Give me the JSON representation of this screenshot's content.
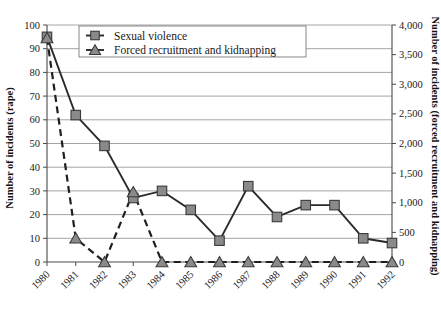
{
  "chart_data": {
    "type": "line",
    "title": "",
    "xlabel": "",
    "ylabel": "Number of incidents (rape)",
    "y2label": "Number of incidents (forced recruitment and kidnapping)",
    "categories": [
      "1980",
      "1981",
      "1982",
      "1983",
      "1984",
      "1985",
      "1986",
      "1987",
      "1988",
      "1989",
      "1990",
      "1991",
      "1992"
    ],
    "x": [
      1980,
      1981,
      1982,
      1983,
      1984,
      1985,
      1986,
      1987,
      1988,
      1989,
      1990,
      1991,
      1992
    ],
    "ylim": [
      0,
      100
    ],
    "y2lim": [
      0,
      4000
    ],
    "yticks": [
      0,
      10,
      20,
      30,
      40,
      50,
      60,
      70,
      80,
      90,
      100
    ],
    "ytick_labels": [
      "0",
      "10",
      "20",
      "30",
      "40",
      "50",
      "60",
      "70",
      "80",
      "90",
      "100"
    ],
    "y2ticks": [
      0,
      500,
      1000,
      1500,
      2000,
      2500,
      3000,
      3500,
      4000
    ],
    "y2tick_labels": [
      "0",
      "500",
      "1,000",
      "1,500",
      "2,000",
      "2,500",
      "3,000",
      "3,500",
      "4,000"
    ],
    "grid": true,
    "grid_axis": "y",
    "legend_position": "top-left-inside",
    "series": [
      {
        "name": "Sexual violence",
        "axis": "left",
        "marker": "square",
        "linestyle": "solid",
        "color": "#8a8a8a",
        "values": [
          95,
          62,
          49,
          27,
          30,
          22,
          9,
          32,
          19,
          24,
          24,
          10,
          8
        ]
      },
      {
        "name": "Forced recruitment and kidnapping",
        "axis": "right",
        "marker": "triangle",
        "linestyle": "dashed",
        "color": "#8a8a8a",
        "values": [
          3780,
          400,
          0,
          1180,
          0,
          0,
          0,
          0,
          0,
          0,
          0,
          0,
          0
        ]
      }
    ]
  },
  "legend": {
    "entries": [
      {
        "label": "Sexual violence",
        "marker": "square"
      },
      {
        "label": "Forced recruitment and kidnapping",
        "marker": "triangle"
      }
    ]
  },
  "axes": {
    "left_title": "Number of incidents (rape)",
    "right_title": "Number of incidents (forced recruitment and kidnapping)"
  }
}
